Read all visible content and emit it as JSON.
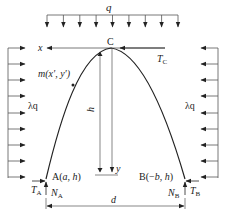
{
  "diagram": {
    "colors": {
      "line": "#222222",
      "axis": "#555555",
      "background": "#ffffff"
    },
    "labels": {
      "top_load": "q",
      "left_load": "λq",
      "right_load": "λq",
      "apex": "C",
      "x_axis": "x",
      "y_axis": "y",
      "apex_force": "T",
      "apex_force_sub": "C",
      "point_m": "m(x′, y′)",
      "height": "h",
      "support_a": "A(a, h)",
      "support_b": "B(−b, h)",
      "ta": "T",
      "ta_sub": "A",
      "na": "N",
      "na_sub": "A",
      "tb": "T",
      "tb_sub": "B",
      "nb": "N",
      "nb_sub": "B",
      "span": "d"
    },
    "top_load_arrows": 9,
    "side_load_arrows": 9
  }
}
